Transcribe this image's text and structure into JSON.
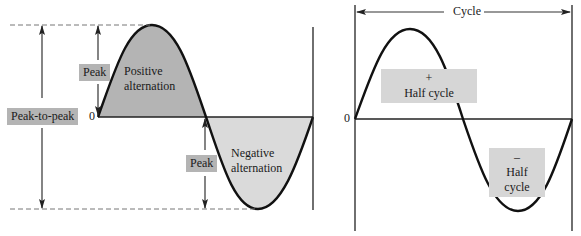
{
  "left_diagram": {
    "labels": {
      "peak_top": "Peak",
      "positive_alternation_line1": "Positive",
      "positive_alternation_line2": "alternation",
      "peak_to_peak": "Peak-to-peak",
      "zero": "0",
      "peak_bottom": "Peak",
      "negative_alternation_line1": "Negative",
      "negative_alternation_line2": "alternation"
    },
    "colors": {
      "positive_fill": "#b4b4b4",
      "negative_fill": "#dadada",
      "label_box": "#b4b4b4",
      "stroke": "#111111"
    }
  },
  "right_diagram": {
    "labels": {
      "cycle": "Cycle",
      "zero": "0",
      "positive_sign": "+",
      "positive_half": "Half cycle",
      "negative_sign": "–",
      "negative_half": "Half cycle"
    },
    "colors": {
      "label_box": "#d6d6d6",
      "stroke": "#111111"
    }
  }
}
